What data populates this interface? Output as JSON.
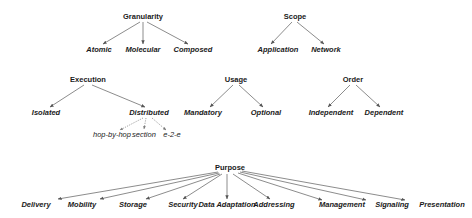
{
  "diagram": {
    "type": "taxonomy-trees",
    "trees": [
      {
        "id": "granularity",
        "label": "Granularity",
        "pos": [
          143,
          19
        ],
        "children": [
          {
            "label": "Atomic",
            "pos": [
              99,
              52
            ]
          },
          {
            "label": "Molecular",
            "pos": [
              143,
              52
            ]
          },
          {
            "label": "Composed",
            "pos": [
              193,
              52
            ]
          }
        ]
      },
      {
        "id": "scope",
        "label": "Scope",
        "pos": [
          295,
          19
        ],
        "children": [
          {
            "label": "Application",
            "pos": [
              278,
              52
            ]
          },
          {
            "label": "Network",
            "pos": [
              326,
              52
            ]
          }
        ]
      },
      {
        "id": "execution",
        "label": "Execution",
        "pos": [
          88,
          82
        ],
        "children": [
          {
            "label": "Isolated",
            "pos": [
              46,
              115
            ]
          },
          {
            "label": "Distributed",
            "pos": [
              149,
              115
            ],
            "children": [
              {
                "label": "hop-by-hop",
                "pos": [
                  112,
                  136
                ]
              },
              {
                "label": "section",
                "pos": [
                  144,
                  136
                ]
              },
              {
                "label": "e-2-e",
                "pos": [
                  172,
                  136
                ]
              }
            ]
          }
        ]
      },
      {
        "id": "usage",
        "label": "Usage",
        "pos": [
          236,
          82
        ],
        "children": [
          {
            "label": "Mandatory",
            "pos": [
              203,
              115
            ]
          },
          {
            "label": "Optional",
            "pos": [
              266,
              115
            ]
          }
        ]
      },
      {
        "id": "order",
        "label": "Order",
        "pos": [
          353,
          82
        ],
        "children": [
          {
            "label": "Independent",
            "pos": [
              331,
              115
            ]
          },
          {
            "label": "Dependent",
            "pos": [
              384,
              115
            ]
          }
        ]
      },
      {
        "id": "purpose",
        "label": "Purpose",
        "pos": [
          230,
          170
        ],
        "children": [
          {
            "label": "Delivery",
            "pos": [
              36,
              207
            ]
          },
          {
            "label": "Mobility",
            "pos": [
              82,
              207
            ]
          },
          {
            "label": "Storage",
            "pos": [
              133,
              207
            ]
          },
          {
            "label": "Security",
            "pos": [
              183,
              207
            ]
          },
          {
            "label": "Data Adaptation",
            "pos": [
              227,
              207
            ]
          },
          {
            "label": "Addressing",
            "pos": [
              274,
              207
            ]
          },
          {
            "label": "Management",
            "pos": [
              342,
              207
            ]
          },
          {
            "label": "Signaling",
            "pos": [
              392,
              207
            ]
          },
          {
            "label": "Presentation",
            "pos": [
              442,
              207
            ]
          }
        ]
      }
    ],
    "colors": {
      "edge": "#6e6e6e",
      "text": "#1a1a1a",
      "background": "#ffffff"
    }
  }
}
